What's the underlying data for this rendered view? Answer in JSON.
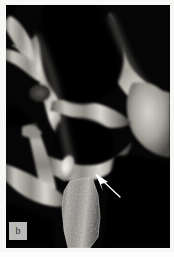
{
  "figure": {
    "panel_letter": "b",
    "modality": "grayscale-radiograph",
    "caption_text": "",
    "background_color": "#f7f7f5",
    "film_color": "#050505",
    "bone_bright": "#e8e6e2",
    "bone_mid": "#9a9790",
    "bone_dark": "#3c3b38"
  },
  "annotations": {
    "arrow": {
      "name": "pointer-arrow",
      "color": "#ffffff",
      "tip_x": 97,
      "tip_y": 175,
      "tail_x": 120,
      "tail_y": 198,
      "label": ""
    }
  },
  "regions": [
    {
      "name": "maxillary-sinus-air-space",
      "tone": "black"
    },
    {
      "name": "infratemporal-fossa-air-space",
      "tone": "black"
    },
    {
      "name": "zygomatic-arch-bone",
      "tone": "bright"
    },
    {
      "name": "pterygoid-plate-bone",
      "tone": "mid"
    },
    {
      "name": "condylar-head-bone",
      "tone": "bright"
    },
    {
      "name": "mandibular-ramus-trabecular-bone",
      "tone": "mottled"
    },
    {
      "name": "coronoid-process-bone",
      "tone": "mid"
    },
    {
      "name": "calcified-focus",
      "tone": "bright"
    }
  ]
}
